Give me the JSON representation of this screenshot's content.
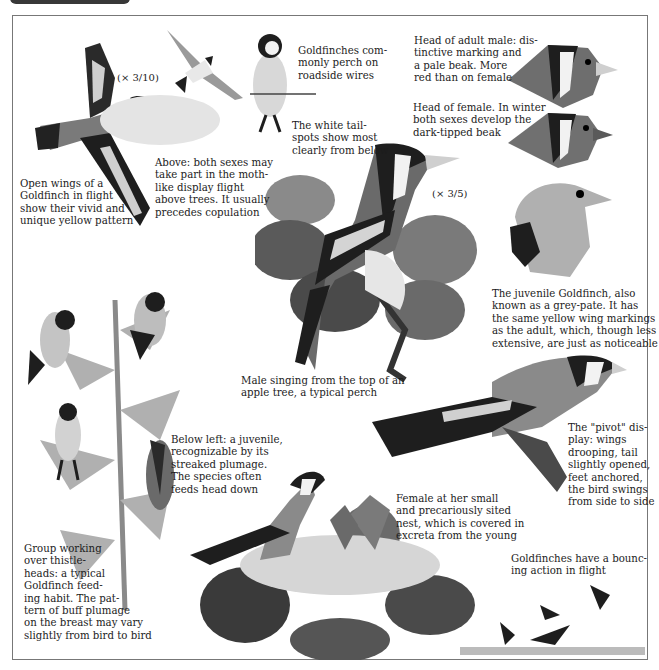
{
  "page": {
    "title_fragment": "Goldfinch"
  },
  "scales": {
    "flight_scale": "(× 3/10)",
    "main_scale": "(× 3/5)"
  },
  "captions": {
    "open_wings": "Open wings of a\nGoldfinch in flight\nshow their vivid and\nunique yellow pattern",
    "display_flight": "Above: both sexes may\ntake part in the moth-\nlike display flight\nabove trees. It usually\nprecedes copulation",
    "wires": "Goldfinches com-\nmonly perch on\nroadside wires",
    "tail_spots": "The white tail-\nspots show most\nclearly from below",
    "adult_male_head": "Head of adult male: dis-\ntinctive marking and\na pale beak. More\nred than on female",
    "female_head": "Head of female. In winter\nboth sexes develop the\ndark-tipped beak",
    "juvenile": "The juvenile Goldfinch, also\nknown as a grey-pate. It has\nthe same yellow wing markings\nas the adult, which, though less\nextensive, are just as noticeable",
    "male_singing": "Male singing from the top of an\napple tree, a typical perch",
    "pivot_display": "The \"pivot\" dis-\nplay: wings\ndrooping, tail\nslightly opened,\nfeet anchored,\nthe bird swings\nfrom side to side",
    "below_left": "Below left: a juvenile,\nrecognizable by its\nstreaked plumage.\nThe species often\nfeeds head down",
    "group_thistle": "Group working\nover thistle-\nheads: a typical\nGoldfinch feed-\ning habit. The pat-\ntern of buff plumage\non the breast may vary\nslightly from bird to bird",
    "female_nest": "Female at her small\nand precariously sited\nnest, which is covered in\nexcreta from the young",
    "bouncing": "Goldfinches have a bounc-\ning action in flight"
  },
  "colors": {
    "ink": "#1c1c1c",
    "frame": "#777777",
    "bird_dark": "#1e1e1e",
    "bird_mid": "#6e6e6e",
    "bird_light": "#b8b8b8",
    "leaf": "#5a5a5a",
    "face_white": "#f2f2f2"
  }
}
